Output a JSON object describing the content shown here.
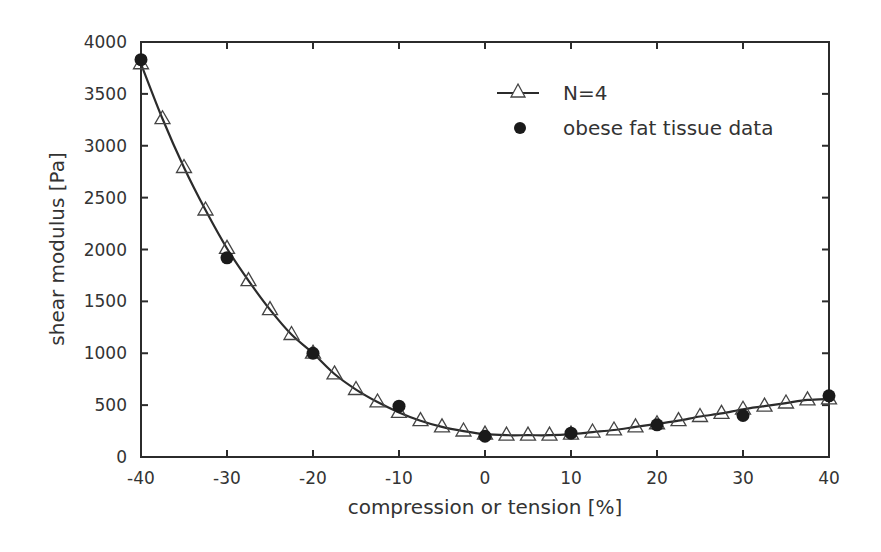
{
  "chart_data": {
    "type": "line",
    "title": "",
    "xlabel": "compression or tension [%]",
    "ylabel": "shear modulus [Pa]",
    "xlim": [
      -40,
      40
    ],
    "ylim": [
      0,
      4000
    ],
    "xticks": [
      -40,
      -30,
      -20,
      -10,
      0,
      10,
      20,
      30,
      40
    ],
    "yticks": [
      0,
      500,
      1000,
      1500,
      2000,
      2500,
      3000,
      3500,
      4000
    ],
    "grid": false,
    "legend_position": "upper right",
    "series": [
      {
        "name": "N=4",
        "style": "line-with-open-triangles",
        "color": "#2b2b2b",
        "x": [
          -40,
          -37.5,
          -35,
          -32.5,
          -30,
          -27.5,
          -25,
          -22.5,
          -20,
          -17.5,
          -15,
          -12.5,
          -10,
          -7.5,
          -5,
          -2.5,
          0,
          2.5,
          5,
          7.5,
          10,
          12.5,
          15,
          17.5,
          20,
          22.5,
          25,
          27.5,
          30,
          32.5,
          35,
          37.5,
          40
        ],
        "values": [
          3790,
          3260,
          2790,
          2380,
          2010,
          1700,
          1420,
          1180,
          1000,
          800,
          650,
          530,
          430,
          350,
          290,
          250,
          220,
          210,
          210,
          210,
          220,
          240,
          260,
          290,
          320,
          350,
          390,
          420,
          460,
          490,
          520,
          550,
          560
        ]
      },
      {
        "name": "obese fat tissue data",
        "style": "filled-circles",
        "color": "#1a1a1a",
        "x": [
          -40,
          -30,
          -20,
          -10,
          0,
          10,
          20,
          30,
          40
        ],
        "values": [
          3830,
          1920,
          1000,
          490,
          200,
          230,
          310,
          400,
          590
        ]
      }
    ]
  },
  "legend": {
    "items": [
      {
        "label": "N=4",
        "icon": "line-triangle-icon"
      },
      {
        "label": "obese fat tissue data",
        "icon": "filled-circle-icon"
      }
    ]
  },
  "axes": {
    "x_label": "compression or tension [%]",
    "y_label": "shear modulus [Pa]",
    "x_tick_labels": [
      "-40",
      "-30",
      "-20",
      "-10",
      "0",
      "10",
      "20",
      "30",
      "40"
    ],
    "y_tick_labels": [
      "0",
      "500",
      "1000",
      "1500",
      "2000",
      "2500",
      "3000",
      "3500",
      "4000"
    ]
  }
}
